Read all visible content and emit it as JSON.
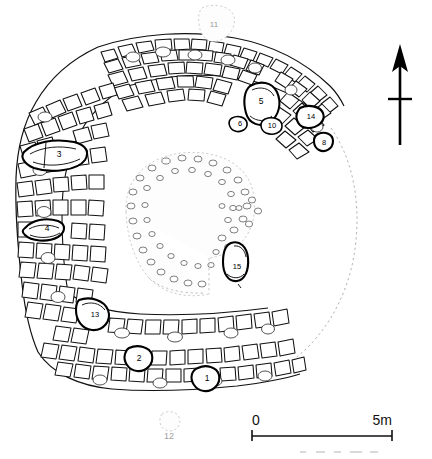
{
  "figure": {
    "kind": "archaeological-site-plan"
  },
  "north_arrow": {
    "name": "north-arrow",
    "label": ""
  },
  "scale_bar": {
    "start_label": "0",
    "end_label": "5m",
    "length_m": 5
  },
  "features": [
    {
      "id": "f1",
      "label": "1",
      "x": 207,
      "y": 380,
      "style": "dark"
    },
    {
      "id": "f2",
      "label": "2",
      "x": 139,
      "y": 360,
      "style": "dark"
    },
    {
      "id": "f3",
      "label": "3",
      "x": 59,
      "y": 155,
      "style": "dark"
    },
    {
      "id": "f4",
      "label": "4",
      "x": 47,
      "y": 229,
      "style": "dark"
    },
    {
      "id": "f5",
      "label": "5",
      "x": 261,
      "y": 102,
      "style": "dark"
    },
    {
      "id": "f6",
      "label": "6",
      "x": 240,
      "y": 125,
      "style": "dark"
    },
    {
      "id": "f8",
      "label": "8",
      "x": 325,
      "y": 143,
      "style": "dark"
    },
    {
      "id": "f10",
      "label": "10",
      "x": 272,
      "y": 126,
      "style": "dark"
    },
    {
      "id": "f11",
      "label": "11",
      "x": 214,
      "y": 26,
      "style": "faint"
    },
    {
      "id": "f12",
      "label": "12",
      "x": 169,
      "y": 436,
      "style": "faint"
    },
    {
      "id": "f13",
      "label": "13",
      "x": 95,
      "y": 315,
      "style": "dark"
    },
    {
      "id": "f14",
      "label": "14",
      "x": 311,
      "y": 117,
      "style": "dark"
    },
    {
      "id": "f15",
      "label": "15",
      "x": 238,
      "y": 268,
      "style": "dark"
    }
  ],
  "colors": {
    "ink": "#111111",
    "paper": "#ffffff",
    "faint": "#b9b9b9"
  }
}
